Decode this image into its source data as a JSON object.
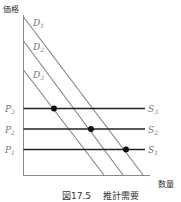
{
  "figure": {
    "caption_number": "図17.5",
    "caption_title": "推計需要",
    "y_axis_label": "価格",
    "x_axis_label": "数量"
  },
  "demand_curves": [
    {
      "name": "D",
      "sub": "1"
    },
    {
      "name": "D",
      "sub": "2"
    },
    {
      "name": "D",
      "sub": "3"
    }
  ],
  "supply_lines": [
    {
      "price": "P",
      "price_sub": "3",
      "name": "S",
      "sub": "3"
    },
    {
      "price": "P",
      "price_sub": "2",
      "name": "S",
      "sub": "2"
    },
    {
      "price": "P",
      "price_sub": "1",
      "name": "S",
      "sub": "1"
    }
  ]
}
